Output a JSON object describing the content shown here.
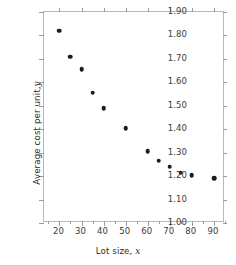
{
  "chart_data": {
    "type": "scatter",
    "title": "",
    "xlabel": "Lot size, x",
    "xlabel_text": "Lot size,",
    "xlabel_var": "x",
    "ylabel": "Average cost per unit, y",
    "ylabel_text": "Average cost per unit,",
    "ylabel_var": "y",
    "xlim": [
      13,
      95
    ],
    "ylim": [
      1.0,
      1.9
    ],
    "grid": false,
    "legend": null,
    "marker_color": "#1c1c1c",
    "axis_color": "#b9b9b9",
    "x": [
      20,
      25,
      30,
      35,
      40,
      50,
      60,
      65,
      70,
      75,
      80,
      90
    ],
    "y": [
      1.82,
      1.71,
      1.655,
      1.555,
      1.49,
      1.405,
      1.305,
      1.265,
      1.24,
      1.215,
      1.205,
      1.19
    ],
    "points": [
      {
        "x": 20,
        "y": 1.82
      },
      {
        "x": 25,
        "y": 1.71
      },
      {
        "x": 30,
        "y": 1.655
      },
      {
        "x": 35,
        "y": 1.555
      },
      {
        "x": 40,
        "y": 1.49
      },
      {
        "x": 50,
        "y": 1.405
      },
      {
        "x": 60,
        "y": 1.305
      },
      {
        "x": 65,
        "y": 1.265
      },
      {
        "x": 70,
        "y": 1.24
      },
      {
        "x": 75,
        "y": 1.215
      },
      {
        "x": 80,
        "y": 1.205
      },
      {
        "x": 90,
        "y": 1.19
      }
    ],
    "yticks": [
      1.0,
      1.1,
      1.2,
      1.3,
      1.4,
      1.5,
      1.6,
      1.7,
      1.8,
      1.9
    ],
    "ytick_labels": [
      "1.00",
      "1.10",
      "1.20",
      "1.30",
      "1.40",
      "1.50",
      "1.60",
      "1.70",
      "1.80",
      "1.90"
    ],
    "xticks": [
      20,
      30,
      40,
      50,
      60,
      70,
      80,
      90
    ],
    "xtick_labels": [
      "20",
      "30",
      "40",
      "50",
      "60",
      "70",
      "80",
      "90"
    ],
    "xticks_minor": [
      15,
      25,
      35,
      45,
      55,
      65,
      75,
      85,
      95
    ]
  }
}
